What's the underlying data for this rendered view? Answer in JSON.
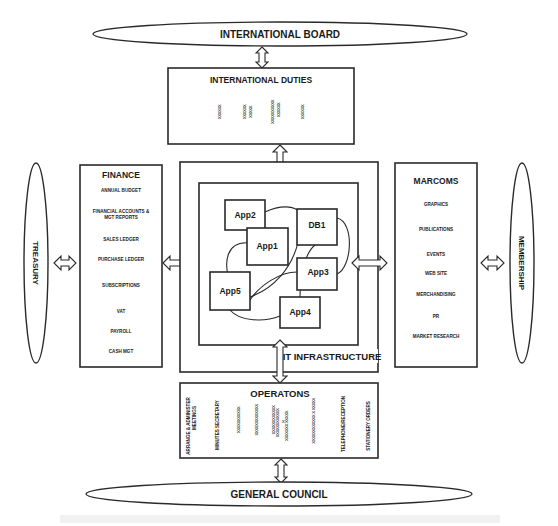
{
  "international_board": {
    "label": "INTERNATIONAL BOARD"
  },
  "international_duties": {
    "title": "INTERNATIONAL DUTIES",
    "placeholders": [
      "xxxxxx",
      "xxxxxx",
      "xxxxx",
      "xxxxxxxxxx",
      "xxxxxx",
      "xxxxxx"
    ]
  },
  "treasury": {
    "label": "TREASURY"
  },
  "membership": {
    "label": "MEMBERSHIP"
  },
  "finance": {
    "title": "FINANCE",
    "items": [
      "ANNUAL BUDGET",
      "FINANCIAL ACCOUNTS &",
      "MGT REPORTS",
      "SALES LEDGER",
      "PURCHASE LEDGER",
      "SUBSCRIPTIONS",
      "VAT",
      "PAYROLL",
      "CASH MGT"
    ]
  },
  "marcoms": {
    "title": "MARCOMS",
    "items": [
      "GRAPHICS",
      "PUBLICATIONS",
      "EVENTS",
      "WEB SITE",
      "MERCHANDISING",
      "PR",
      "MARKET RESEARCH"
    ]
  },
  "it_infrastructure": {
    "label": "IT INFRASTRUCTURE",
    "nodes": [
      {
        "id": "app2",
        "label": "App2"
      },
      {
        "id": "app1",
        "label": "App1"
      },
      {
        "id": "db1",
        "label": "DB1"
      },
      {
        "id": "app3",
        "label": "App3"
      },
      {
        "id": "app5",
        "label": "App5"
      },
      {
        "id": "app4",
        "label": "App4"
      }
    ],
    "connections": [
      [
        "app2",
        "db1"
      ],
      [
        "app1",
        "app5"
      ],
      [
        "db1",
        "app5"
      ],
      [
        "db1",
        "app3"
      ],
      [
        "db1",
        "app4"
      ],
      [
        "app3",
        "app5"
      ],
      [
        "app5",
        "app4"
      ]
    ]
  },
  "operations": {
    "title": "OPERATONS",
    "columns": [
      "ARRANGE & ADMINISTER",
      "MEETINGS",
      "MINUTES SECRETARY",
      "xxxxxxxxxxx",
      "xxxxxxxxxxxxx",
      "xxxxxxxxxxxx",
      "xxxxxxxxxxxx",
      "x",
      "xxxxxxx xxxxx",
      "xxxxxxxxxxxx x xxxxx",
      "TELEPHONE/RECEPTION",
      "STATIONERY ORDERS"
    ]
  },
  "general_council": {
    "label": "GENERAL COUNCIL"
  }
}
